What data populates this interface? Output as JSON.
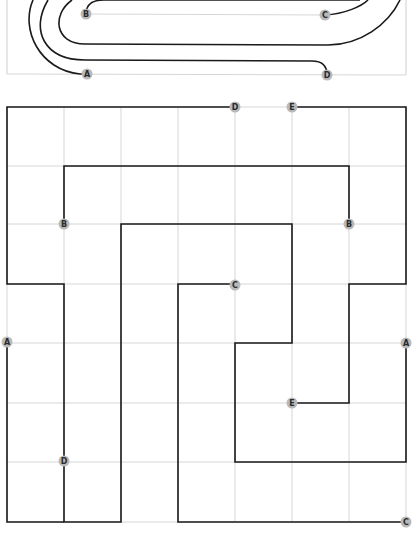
{
  "colors": {
    "wire": "#1a1a1a",
    "grid": "#d6d6d6",
    "label_dot": "#b9b9b9",
    "label_text": "#2a2a2a"
  },
  "top_panel": {
    "labels": [
      {
        "id": "B",
        "text": "B",
        "x": 86,
        "y": 14
      },
      {
        "id": "C",
        "text": "C",
        "x": 325,
        "y": 15
      },
      {
        "id": "A",
        "text": "A",
        "x": 87,
        "y": 74
      },
      {
        "id": "D",
        "text": "D",
        "x": 327,
        "y": 75
      }
    ]
  },
  "grid_panel": {
    "columns": 7,
    "rows": 7,
    "labels": [
      {
        "id": "D-top",
        "text": "D",
        "x": 235,
        "y": 107
      },
      {
        "id": "E-top",
        "text": "E",
        "x": 292,
        "y": 107
      },
      {
        "id": "B-left",
        "text": "B",
        "x": 64,
        "y": 224
      },
      {
        "id": "B-right",
        "text": "B",
        "x": 349,
        "y": 224
      },
      {
        "id": "C-mid",
        "text": "C",
        "x": 235,
        "y": 285
      },
      {
        "id": "A-left",
        "text": "A",
        "x": 7,
        "y": 342
      },
      {
        "id": "A-right",
        "text": "A",
        "x": 406,
        "y": 343
      },
      {
        "id": "E-mid",
        "text": "E",
        "x": 292,
        "y": 403
      },
      {
        "id": "D-bottom",
        "text": "D",
        "x": 64,
        "y": 461
      },
      {
        "id": "C-bottom",
        "text": "C",
        "x": 406,
        "y": 522
      }
    ]
  }
}
